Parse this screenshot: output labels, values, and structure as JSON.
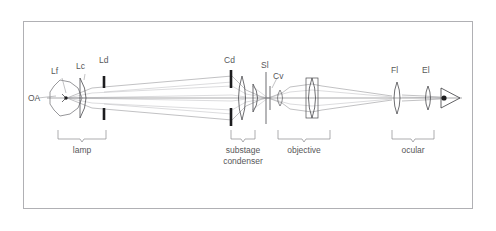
{
  "figure": {
    "border_color": "#b0b0b4",
    "background_color": "#ffffff",
    "ink_color": "#4a4a4e",
    "label_color": "#58585a",
    "ray_color": "#8d8d91"
  },
  "axis": {
    "label": "OA",
    "description": "optical axis"
  },
  "components": [
    {
      "id": "lf",
      "label": "Lf",
      "name": "lamp-filament",
      "x": 66,
      "y": 98
    },
    {
      "id": "lc",
      "label": "Lc",
      "name": "lamp-collector-lens",
      "x": 84,
      "y": 98
    },
    {
      "id": "ld",
      "label": "Ld",
      "name": "lamp-diaphragm",
      "x": 104,
      "y": 98
    },
    {
      "id": "cd",
      "label": "Cd",
      "name": "condenser-diaphragm",
      "x": 231,
      "y": 98
    },
    {
      "id": "sl",
      "label": "Sl",
      "name": "slide",
      "x": 266,
      "y": 98
    },
    {
      "id": "cv",
      "label": "Cv",
      "name": "cover-glass",
      "x": 277,
      "y": 98
    },
    {
      "id": "fl",
      "label": "Fl",
      "name": "field-lens",
      "x": 397,
      "y": 98
    },
    {
      "id": "el",
      "label": "El",
      "name": "eye-lens",
      "x": 428,
      "y": 98
    }
  ],
  "groups": [
    {
      "id": "lamp",
      "label": "lamp",
      "lines": [
        "lamp"
      ],
      "x": 82,
      "y": 152
    },
    {
      "id": "substage-condenser",
      "label": "substage condenser",
      "lines": [
        "substage",
        "condenser"
      ],
      "x": 243,
      "y": 152
    },
    {
      "id": "objective",
      "label": "objective",
      "lines": [
        "objective"
      ],
      "x": 304,
      "y": 152
    },
    {
      "id": "ocular",
      "label": "ocular",
      "lines": [
        "ocular"
      ],
      "x": 413,
      "y": 152
    }
  ],
  "labels": {
    "lf": "Lf",
    "lc": "Lc",
    "ld": "Ld",
    "cd": "Cd",
    "sl": "Sl",
    "cv": "Cv",
    "fl": "Fl",
    "el": "El",
    "oa": "OA",
    "lamp": "lamp",
    "substage": "substage",
    "condenser": "condenser",
    "objective": "objective",
    "ocular": "ocular"
  }
}
